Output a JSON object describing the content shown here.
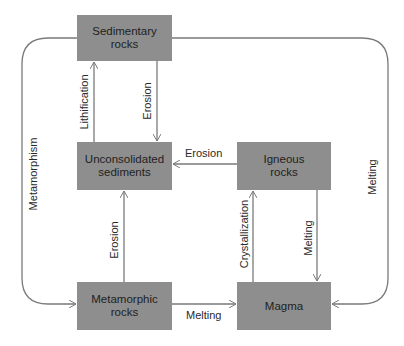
{
  "colors": {
    "node_fill": "#8e8e8e",
    "line": "#7a7a7a",
    "text": "#1e1e1e",
    "background": "#ffffff"
  },
  "nodes": {
    "sedimentary": {
      "line1": "Sedimentary",
      "line2": "rocks"
    },
    "unconsolidated": {
      "line1": "Unconsolidated",
      "line2": "sediments"
    },
    "igneous": {
      "line1": "Igneous",
      "line2": "rocks"
    },
    "metamorphic": {
      "line1": "Metamorphic",
      "line2": "rocks"
    },
    "magma": {
      "line1": "Magma"
    }
  },
  "edges": {
    "lithification": "Lithification",
    "erosion_sed_to_unc": "Erosion",
    "erosion_ign_to_unc": "Erosion",
    "erosion_met_to_unc": "Erosion",
    "crystallization": "Crystallization",
    "melting_ign_to_magma": "Melting",
    "melting_met_to_magma": "Melting",
    "metamorphism_loop": "Metamorphism",
    "melting_loop": "Melting"
  }
}
